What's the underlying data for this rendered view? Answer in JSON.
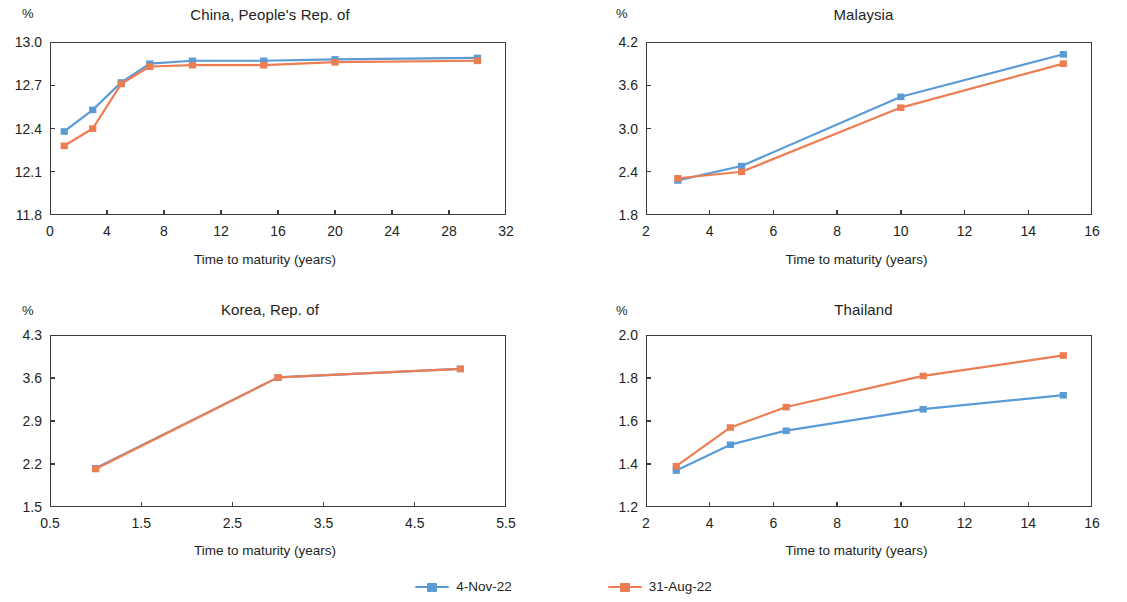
{
  "legend": {
    "entries": [
      {
        "label": "4-Nov-22",
        "color": "#5b9bd5"
      },
      {
        "label": "31-Aug-22",
        "color": "#ed7d52"
      }
    ]
  },
  "common": {
    "unit_label": "%",
    "x_axis_title": "Time to maturity (years)"
  },
  "chart_data": [
    {
      "id": "china",
      "type": "line",
      "title": "China, People's Rep. of",
      "xlabel": "Time to maturity (years)",
      "ylabel": "%",
      "xlim": [
        0,
        32
      ],
      "ylim": [
        11.8,
        13.0
      ],
      "xticks": [
        0,
        4,
        8,
        12,
        16,
        20,
        24,
        28,
        32
      ],
      "xtick_labels": [
        "0",
        "4",
        "8",
        "12",
        "16",
        "20",
        "24",
        "28",
        "32"
      ],
      "yticks": [
        11.8,
        12.1,
        12.4,
        12.7,
        13.0
      ],
      "ytick_labels": [
        "11.8",
        "12.1",
        "12.4",
        "12.7",
        "13.0"
      ],
      "grid": false,
      "legend_position": "bottom-figure",
      "series": [
        {
          "name": "4-Nov-22",
          "color": "#5b9bd5",
          "x": [
            1,
            3,
            5,
            7,
            10,
            15,
            20,
            30
          ],
          "values": [
            12.38,
            12.53,
            12.72,
            12.85,
            12.87,
            12.87,
            12.88,
            12.89
          ]
        },
        {
          "name": "31-Aug-22",
          "color": "#ed7d52",
          "x": [
            1,
            3,
            5,
            7,
            10,
            15,
            20,
            30
          ],
          "values": [
            12.28,
            12.4,
            12.71,
            12.83,
            12.84,
            12.84,
            12.86,
            12.87
          ]
        }
      ]
    },
    {
      "id": "malaysia",
      "type": "line",
      "title": "Malaysia",
      "xlabel": "Time to maturity (years)",
      "ylabel": "%",
      "xlim": [
        2,
        16
      ],
      "ylim": [
        1.8,
        4.2
      ],
      "xticks": [
        2,
        4,
        6,
        8,
        10,
        12,
        14,
        16
      ],
      "xtick_labels": [
        "2",
        "4",
        "6",
        "8",
        "10",
        "12",
        "14",
        "16"
      ],
      "yticks": [
        1.8,
        2.4,
        3.0,
        3.6,
        4.2
      ],
      "ytick_labels": [
        "1.8",
        "2.4",
        "3.0",
        "3.6",
        "4.2"
      ],
      "grid": false,
      "legend_position": "bottom-figure",
      "series": [
        {
          "name": "4-Nov-22",
          "color": "#5b9bd5",
          "x": [
            3,
            5,
            10,
            15.1
          ],
          "values": [
            2.28,
            2.48,
            3.44,
            4.03
          ]
        },
        {
          "name": "31-Aug-22",
          "color": "#ed7d52",
          "x": [
            3,
            5,
            10,
            15.1
          ],
          "values": [
            2.31,
            2.4,
            3.29,
            3.9
          ]
        }
      ]
    },
    {
      "id": "korea",
      "type": "line",
      "title": "Korea, Rep. of",
      "xlabel": "Time to maturity (years)",
      "ylabel": "%",
      "xlim": [
        0.5,
        5.5
      ],
      "ylim": [
        1.5,
        4.3
      ],
      "xticks": [
        0.5,
        1.5,
        2.5,
        3.5,
        4.5,
        5.5
      ],
      "xtick_labels": [
        "0.5",
        "1.5",
        "2.5",
        "3.5",
        "4.5",
        "5.5"
      ],
      "yticks": [
        1.5,
        2.2,
        2.9,
        3.6,
        4.3
      ],
      "ytick_labels": [
        "1.5",
        "2.2",
        "2.9",
        "3.6",
        "4.3"
      ],
      "grid": false,
      "legend_position": "bottom-figure",
      "series": [
        {
          "name": "4-Nov-22",
          "color": "#5b9bd5",
          "x": [
            1,
            3,
            5
          ],
          "values": [
            2.13,
            3.61,
            3.75
          ]
        },
        {
          "name": "31-Aug-22",
          "color": "#ed7d52",
          "x": [
            1,
            3,
            5
          ],
          "values": [
            2.12,
            3.61,
            3.75
          ]
        }
      ]
    },
    {
      "id": "thailand",
      "type": "line",
      "title": "Thailand",
      "xlabel": "Time to maturity (years)",
      "ylabel": "%",
      "xlim": [
        2,
        16
      ],
      "ylim": [
        1.2,
        2.0
      ],
      "xticks": [
        2,
        4,
        6,
        8,
        10,
        12,
        14,
        16
      ],
      "xtick_labels": [
        "2",
        "4",
        "6",
        "8",
        "10",
        "12",
        "14",
        "16"
      ],
      "yticks": [
        1.2,
        1.4,
        1.6,
        1.8,
        2.0
      ],
      "ytick_labels": [
        "1.2",
        "1.4",
        "1.6",
        "1.8",
        "2.0"
      ],
      "grid": false,
      "legend_position": "bottom-figure",
      "series": [
        {
          "name": "4-Nov-22",
          "color": "#5b9bd5",
          "x": [
            2.95,
            4.65,
            6.4,
            10.7,
            15.1
          ],
          "values": [
            1.37,
            1.49,
            1.555,
            1.655,
            1.72
          ]
        },
        {
          "name": "31-Aug-22",
          "color": "#ed7d52",
          "x": [
            2.95,
            4.65,
            6.4,
            10.7,
            15.1
          ],
          "values": [
            1.39,
            1.57,
            1.665,
            1.81,
            1.905
          ]
        }
      ]
    }
  ]
}
